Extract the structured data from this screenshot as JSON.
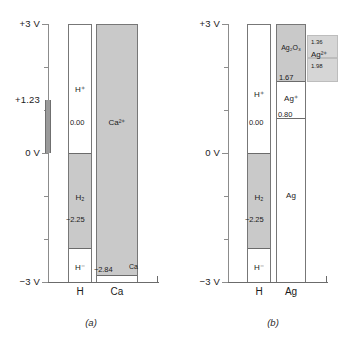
{
  "figure": {
    "axis": {
      "top_label": "+3 V",
      "zero_label": "0 V",
      "bottom_label": "−3 V",
      "special_label": "+1.23",
      "min": -3,
      "max": 3,
      "ticks": [
        3,
        2,
        1,
        0,
        -1,
        -2,
        -3
      ],
      "marker_from": 0.0,
      "marker_to": 1.23
    },
    "panel_a": {
      "caption": "(a)",
      "columns": [
        {
          "name": "H",
          "segments": [
            {
              "species": "H⁺",
              "top": 3.0,
              "bottom": 0.0,
              "fill": "white"
            },
            {
              "species": "H₂",
              "top": 0.0,
              "bottom": -2.25,
              "fill": "shaded"
            },
            {
              "species": "H⁻",
              "top": -2.25,
              "bottom": -3.0,
              "fill": "white"
            }
          ],
          "values": [
            "0.00",
            "−2.25"
          ]
        },
        {
          "name": "Ca",
          "segments": [
            {
              "species": "Ca²⁺",
              "top": 3.0,
              "bottom": -2.84,
              "fill": "shaded"
            },
            {
              "species": "Ca",
              "top": -2.84,
              "bottom": -3.0,
              "fill": "white"
            }
          ],
          "values": [
            "−2.84"
          ]
        }
      ]
    },
    "panel_b": {
      "caption": "(b)",
      "columns": [
        {
          "name": "H",
          "segments": [
            {
              "species": "H⁺",
              "top": 3.0,
              "bottom": 0.0,
              "fill": "white"
            },
            {
              "species": "H₂",
              "top": 0.0,
              "bottom": -2.25,
              "fill": "shaded"
            },
            {
              "species": "H⁻",
              "top": -2.25,
              "bottom": -3.0,
              "fill": "white"
            }
          ],
          "values": [
            "0.00",
            "−2.25"
          ]
        },
        {
          "name": "Ag",
          "segments": [
            {
              "species": "Ag₂O₃",
              "top": 3.0,
              "bottom": 1.67,
              "fill": "shaded"
            },
            {
              "species": "Ag⁺",
              "top": 1.67,
              "bottom": 0.8,
              "fill": "white"
            },
            {
              "species": "Ag",
              "top": 0.8,
              "bottom": -3.0,
              "fill": "white"
            }
          ],
          "values": [
            "1.67",
            "0.80"
          ]
        }
      ],
      "callouts": [
        {
          "species": "Ag²⁺",
          "upper_value": "1.36",
          "lower_value": "1.98"
        }
      ]
    }
  }
}
